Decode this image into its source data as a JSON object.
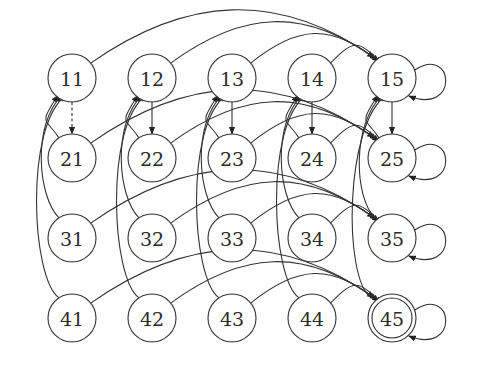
{
  "diagram": {
    "type": "state-transition-graph",
    "colors": {
      "stroke": "#333333",
      "fill": "#ffffff",
      "text": "#2a2a2a"
    },
    "columns_x": [
      72,
      152,
      232,
      312,
      392
    ],
    "rows_y": [
      78,
      158,
      238,
      318
    ],
    "radius": 24,
    "nodes": [
      {
        "id": "11",
        "label": "11",
        "row": 0,
        "col": 0
      },
      {
        "id": "12",
        "label": "12",
        "row": 0,
        "col": 1
      },
      {
        "id": "13",
        "label": "13",
        "row": 0,
        "col": 2
      },
      {
        "id": "14",
        "label": "14",
        "row": 0,
        "col": 3
      },
      {
        "id": "15",
        "label": "15",
        "row": 0,
        "col": 4
      },
      {
        "id": "21",
        "label": "21",
        "row": 1,
        "col": 0
      },
      {
        "id": "22",
        "label": "22",
        "row": 1,
        "col": 1
      },
      {
        "id": "23",
        "label": "23",
        "row": 1,
        "col": 2
      },
      {
        "id": "24",
        "label": "24",
        "row": 1,
        "col": 3
      },
      {
        "id": "25",
        "label": "25",
        "row": 1,
        "col": 4
      },
      {
        "id": "31",
        "label": "31",
        "row": 2,
        "col": 0
      },
      {
        "id": "32",
        "label": "32",
        "row": 2,
        "col": 1
      },
      {
        "id": "33",
        "label": "33",
        "row": 2,
        "col": 2
      },
      {
        "id": "34",
        "label": "34",
        "row": 2,
        "col": 3
      },
      {
        "id": "35",
        "label": "35",
        "row": 2,
        "col": 4
      },
      {
        "id": "41",
        "label": "41",
        "row": 3,
        "col": 0
      },
      {
        "id": "42",
        "label": "42",
        "row": 3,
        "col": 1
      },
      {
        "id": "43",
        "label": "43",
        "row": 3,
        "col": 2
      },
      {
        "id": "44",
        "label": "44",
        "row": 3,
        "col": 3
      },
      {
        "id": "45",
        "label": "45",
        "row": 3,
        "col": 4,
        "accepting": true
      }
    ],
    "edges": [
      {
        "from": "11",
        "to": "15"
      },
      {
        "from": "12",
        "to": "15"
      },
      {
        "from": "13",
        "to": "15"
      },
      {
        "from": "14",
        "to": "15"
      },
      {
        "from": "21",
        "to": "25"
      },
      {
        "from": "22",
        "to": "25"
      },
      {
        "from": "23",
        "to": "25"
      },
      {
        "from": "24",
        "to": "25"
      },
      {
        "from": "31",
        "to": "35"
      },
      {
        "from": "32",
        "to": "35"
      },
      {
        "from": "33",
        "to": "35"
      },
      {
        "from": "34",
        "to": "35"
      },
      {
        "from": "41",
        "to": "45"
      },
      {
        "from": "42",
        "to": "45"
      },
      {
        "from": "43",
        "to": "45"
      },
      {
        "from": "44",
        "to": "45"
      },
      {
        "from": "11",
        "to": "21",
        "style": "dashed"
      },
      {
        "from": "12",
        "to": "22"
      },
      {
        "from": "13",
        "to": "23"
      },
      {
        "from": "14",
        "to": "24"
      },
      {
        "from": "15",
        "to": "25"
      },
      {
        "from": "21",
        "to": "11"
      },
      {
        "from": "31",
        "to": "11"
      },
      {
        "from": "41",
        "to": "11"
      },
      {
        "from": "22",
        "to": "12"
      },
      {
        "from": "32",
        "to": "12"
      },
      {
        "from": "42",
        "to": "12"
      },
      {
        "from": "23",
        "to": "13"
      },
      {
        "from": "33",
        "to": "13"
      },
      {
        "from": "43",
        "to": "13"
      },
      {
        "from": "24",
        "to": "14"
      },
      {
        "from": "34",
        "to": "14"
      },
      {
        "from": "44",
        "to": "14"
      },
      {
        "from": "25",
        "to": "15"
      },
      {
        "from": "35",
        "to": "15"
      },
      {
        "from": "45",
        "to": "15"
      },
      {
        "from": "15",
        "to": "15",
        "type": "self-loop"
      },
      {
        "from": "25",
        "to": "25",
        "type": "self-loop"
      },
      {
        "from": "35",
        "to": "35",
        "type": "self-loop"
      },
      {
        "from": "45",
        "to": "45",
        "type": "self-loop"
      }
    ]
  }
}
